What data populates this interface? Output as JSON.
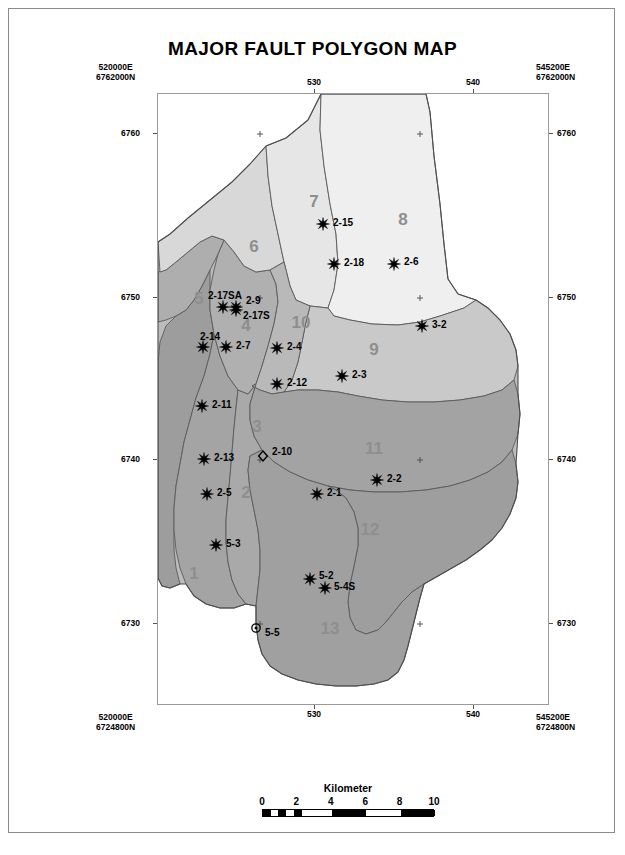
{
  "title": "MAJOR FAULT POLYGON MAP",
  "corners": {
    "top_left": "520000E\n6762000N",
    "top_left_e": "520000E",
    "top_left_n": "6762000N",
    "top_right_e": "545200E",
    "top_right_n": "6762000N",
    "bottom_left_e": "520000E",
    "bottom_left_n": "6724800N",
    "bottom_right_e": "545200E",
    "bottom_right_n": "6724800N"
  },
  "axes": {
    "x_ticks_top": [
      "530",
      "540"
    ],
    "x_ticks_bottom": [
      "530",
      "540"
    ],
    "y_ticks_left": [
      "6760",
      "6750",
      "6740",
      "6730"
    ],
    "y_ticks_right": [
      "6760",
      "6750",
      "6740",
      "6730"
    ]
  },
  "scalebar": {
    "title": "Kilometer",
    "labels": [
      "0",
      "2",
      "4",
      "6",
      "8",
      "10"
    ],
    "min": 0,
    "max": 10,
    "units": "Kilometer"
  },
  "legend_symbols": {
    "well_star": "star-symbol",
    "well_diamond": "diamond-outline-symbol",
    "well_circle": "circle-dot-symbol",
    "grid_tick": "plus-cross-symbol"
  },
  "colors": {
    "polygon_lightest": "#f2f2f2",
    "polygon_light": "#e4e4e4",
    "polygon_mid_light": "#d3d3d3",
    "polygon_mid": "#b6b6b6",
    "polygon_dark": "#9d9d9d",
    "polygon_darkest": "#8f8f8f",
    "outline": "#5a5a5a",
    "label_gray": "#8e8e8e",
    "text": "#000000"
  },
  "polygons": [
    {
      "id": "1",
      "label": "1",
      "shade": "#9d9d9d",
      "label_x": 36,
      "label_y": 485
    },
    {
      "id": "2",
      "label": "2",
      "shade": "#a4a4a4",
      "label_x": 88,
      "label_y": 404
    },
    {
      "id": "3",
      "label": "3",
      "shade": "#a9a9a9",
      "label_x": 99,
      "label_y": 338
    },
    {
      "id": "4",
      "label": "4",
      "shade": "#b0b0b0",
      "label_x": 88,
      "label_y": 237
    },
    {
      "id": "5",
      "label": "5",
      "shade": "#aeaeae",
      "label_x": 41,
      "label_y": 210
    },
    {
      "id": "6",
      "label": "6",
      "shade": "#d8d8d8",
      "label_x": 96,
      "label_y": 158
    },
    {
      "id": "7",
      "label": "7",
      "shade": "#e6e6e6",
      "label_x": 156,
      "label_y": 113
    },
    {
      "id": "8",
      "label": "8",
      "shade": "#efefef",
      "label_x": 245,
      "label_y": 131
    },
    {
      "id": "9",
      "label": "9",
      "shade": "#c9c9c9",
      "label_x": 216,
      "label_y": 261
    },
    {
      "id": "10",
      "label": "10",
      "shade": "#b9b9b9",
      "label_x": 143,
      "label_y": 234
    },
    {
      "id": "11",
      "label": "11",
      "shade": "#a3a3a3",
      "label_x": 216,
      "label_y": 360
    },
    {
      "id": "12",
      "label": "12",
      "shade": "#9e9e9e",
      "label_x": 212,
      "label_y": 441
    },
    {
      "id": "13",
      "label": "13",
      "shade": "#a0a0a0",
      "label_x": 172,
      "label_y": 540
    }
  ],
  "wells": [
    {
      "name": "2-15",
      "symbol": "star",
      "x": 165,
      "y": 130,
      "lx": 175,
      "ly": 128
    },
    {
      "name": "2-18",
      "symbol": "star",
      "x": 176,
      "y": 170,
      "lx": 186,
      "ly": 168
    },
    {
      "name": "2-6",
      "symbol": "star",
      "x": 236,
      "y": 170,
      "lx": 246,
      "ly": 167
    },
    {
      "name": "3-2",
      "symbol": "star",
      "x": 264,
      "y": 232,
      "lx": 274,
      "ly": 230
    },
    {
      "name": "2-17SA",
      "symbol": "star",
      "x": 65,
      "y": 213,
      "lx": 50,
      "ly": 201
    },
    {
      "name": "2-9",
      "symbol": "star",
      "x": 78,
      "y": 213,
      "lx": 88,
      "ly": 206
    },
    {
      "name": "2-17S",
      "symbol": "star",
      "x": 78,
      "y": 216,
      "lx": 85,
      "ly": 221
    },
    {
      "name": "2-14",
      "symbol": "star",
      "x": 45,
      "y": 253,
      "lx": 42,
      "ly": 242
    },
    {
      "name": "2-7",
      "symbol": "star",
      "x": 68,
      "y": 253,
      "lx": 78,
      "ly": 251
    },
    {
      "name": "2-4",
      "symbol": "star",
      "x": 119,
      "y": 254,
      "lx": 129,
      "ly": 252
    },
    {
      "name": "2-12",
      "symbol": "star",
      "x": 119,
      "y": 290,
      "lx": 129,
      "ly": 288
    },
    {
      "name": "2-3",
      "symbol": "star",
      "x": 184,
      "y": 282,
      "lx": 194,
      "ly": 280
    },
    {
      "name": "2-11",
      "symbol": "star",
      "x": 44,
      "y": 312,
      "lx": 54,
      "ly": 310
    },
    {
      "name": "2-13",
      "symbol": "star",
      "x": 46,
      "y": 365,
      "lx": 56,
      "ly": 363
    },
    {
      "name": "2-10",
      "symbol": "diamond",
      "x": 105,
      "y": 362,
      "lx": 114,
      "ly": 357
    },
    {
      "name": "2-5",
      "symbol": "star",
      "x": 49,
      "y": 400,
      "lx": 59,
      "ly": 398
    },
    {
      "name": "2-1",
      "symbol": "star",
      "x": 159,
      "y": 400,
      "lx": 169,
      "ly": 398
    },
    {
      "name": "2-2",
      "symbol": "star",
      "x": 219,
      "y": 386,
      "lx": 229,
      "ly": 384
    },
    {
      "name": "5-3",
      "symbol": "star",
      "x": 58,
      "y": 451,
      "lx": 68,
      "ly": 449
    },
    {
      "name": "5-2",
      "symbol": "star",
      "x": 152,
      "y": 485,
      "lx": 161,
      "ly": 481
    },
    {
      "name": "5-4S",
      "symbol": "star",
      "x": 167,
      "y": 494,
      "lx": 176,
      "ly": 492
    },
    {
      "name": "5-5",
      "symbol": "circle",
      "x": 98,
      "y": 534,
      "lx": 107,
      "ly": 538
    }
  ],
  "grid_crosses": [
    {
      "x": 102,
      "y": 40
    },
    {
      "x": 262,
      "y": 40
    },
    {
      "x": 102,
      "y": 204
    },
    {
      "x": 262,
      "y": 204
    },
    {
      "x": 102,
      "y": 366
    },
    {
      "x": 262,
      "y": 366
    },
    {
      "x": 102,
      "y": 530
    },
    {
      "x": 262,
      "y": 530
    }
  ]
}
